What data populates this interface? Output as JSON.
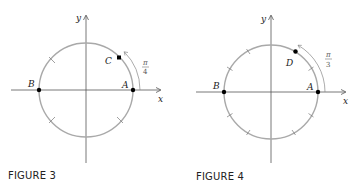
{
  "figures": [
    {
      "caption": "FIGURE 3",
      "center": [
        86,
        90
      ],
      "radius": 47,
      "axis_labels": {
        "x": "x",
        "y": "y"
      },
      "tick_angles_deg": [
        45,
        135,
        225,
        315
      ],
      "points": [
        {
          "label": "A",
          "angle_deg": 0
        },
        {
          "label": "B",
          "angle_deg": 180
        },
        {
          "label": "C",
          "angle_deg": 45
        }
      ],
      "arc_label": {
        "numerator": "π",
        "denominator": "4"
      }
    },
    {
      "caption": "FIGURE 4",
      "center": [
        271,
        92
      ],
      "radius": 47,
      "axis_labels": {
        "x": "x",
        "y": "y"
      },
      "tick_angles_deg": [
        30,
        60,
        120,
        150,
        210,
        240,
        300,
        330
      ],
      "points": [
        {
          "label": "A",
          "angle_deg": 0
        },
        {
          "label": "B",
          "angle_deg": 180
        },
        {
          "label": "D",
          "angle_deg": 60
        }
      ],
      "arc_label": {
        "numerator": "π",
        "denominator": "3"
      }
    }
  ],
  "colors": {
    "circle": "#a9a9a9",
    "axis": "#555555",
    "arc": "#888888",
    "point": "#000000"
  }
}
